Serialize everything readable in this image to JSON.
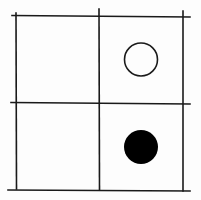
{
  "diagram": {
    "type": "2x2 grid with circles",
    "rows": 2,
    "cols": 2,
    "colors": {
      "background": "#fdfdfd",
      "line": "#1a1a1a",
      "filled": "#000000",
      "hollow_fill": "#fdfdfd"
    },
    "cells": [
      {
        "row": 0,
        "col": 0,
        "content": "empty"
      },
      {
        "row": 0,
        "col": 1,
        "content": "hollow-circle"
      },
      {
        "row": 1,
        "col": 0,
        "content": "empty"
      },
      {
        "row": 1,
        "col": 1,
        "content": "filled-circle"
      }
    ]
  }
}
